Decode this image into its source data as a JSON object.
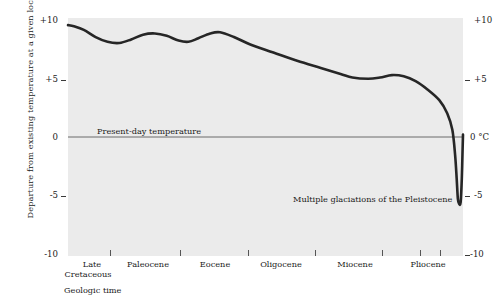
{
  "chart_data": {
    "type": "line",
    "title": "",
    "xlabel": "Geologic time",
    "ylabel": "Departure from existing temperature at a given locality",
    "ylim": [
      -10,
      10
    ],
    "yticks": [
      10,
      5,
      0,
      -5,
      -10
    ],
    "ytick_labels_left": [
      "+10",
      "+5",
      "0",
      "-5",
      "-10"
    ],
    "ytick_labels_right": [
      "+10",
      "+5",
      "0 °C",
      "-5",
      "-10"
    ],
    "grid": false,
    "legend": "none",
    "unit_label": "°C",
    "categories": [
      "Late Cretaceous",
      "Paleocene",
      "Eocene",
      "Oligocene",
      "Miocene",
      "Pliocene"
    ],
    "epoch_labels": [
      {
        "line1": "Late",
        "line2": "Cretaceous",
        "center_px": 92
      },
      {
        "line1": "Paleocene",
        "line2": "",
        "center_px": 148
      },
      {
        "line1": "Eocene",
        "line2": "",
        "center_px": 215
      },
      {
        "line1": "Oligocene",
        "line2": "",
        "center_px": 281
      },
      {
        "line1": "Miocene",
        "line2": "",
        "center_px": 355
      },
      {
        "line1": "Pliocene",
        "line2": "",
        "center_px": 428
      }
    ],
    "annotations": [
      {
        "text": "Present-day temperature",
        "value": 0,
        "role": "zero-line-label"
      },
      {
        "text": "Multiple glaciations of the Pleistocene",
        "value": -5.5,
        "role": "glaciation-label"
      }
    ],
    "series": [
      {
        "name": "Temperature departure",
        "color": "#262626",
        "points": [
          {
            "x": 0.0,
            "y": 9.4
          },
          {
            "x": 1.5,
            "y": 9.3
          },
          {
            "x": 4.0,
            "y": 9.0
          },
          {
            "x": 7.0,
            "y": 8.4
          },
          {
            "x": 10.0,
            "y": 8.0
          },
          {
            "x": 13.0,
            "y": 7.9
          },
          {
            "x": 16.0,
            "y": 8.2
          },
          {
            "x": 19.0,
            "y": 8.6
          },
          {
            "x": 22.0,
            "y": 8.7
          },
          {
            "x": 25.0,
            "y": 8.5
          },
          {
            "x": 28.0,
            "y": 8.1
          },
          {
            "x": 30.5,
            "y": 8.0
          },
          {
            "x": 33.0,
            "y": 8.3
          },
          {
            "x": 36.0,
            "y": 8.7
          },
          {
            "x": 38.5,
            "y": 8.8
          },
          {
            "x": 42.0,
            "y": 8.4
          },
          {
            "x": 46.0,
            "y": 7.8
          },
          {
            "x": 52.0,
            "y": 7.1
          },
          {
            "x": 58.0,
            "y": 6.4
          },
          {
            "x": 64.0,
            "y": 5.8
          },
          {
            "x": 69.0,
            "y": 5.3
          },
          {
            "x": 72.0,
            "y": 5.0
          },
          {
            "x": 76.0,
            "y": 4.9
          },
          {
            "x": 79.0,
            "y": 5.0
          },
          {
            "x": 82.0,
            "y": 5.2
          },
          {
            "x": 85.0,
            "y": 5.1
          },
          {
            "x": 88.0,
            "y": 4.7
          },
          {
            "x": 91.0,
            "y": 4.0
          },
          {
            "x": 94.0,
            "y": 3.1
          },
          {
            "x": 96.0,
            "y": 2.0
          },
          {
            "x": 97.3,
            "y": 0.6
          },
          {
            "x": 98.0,
            "y": -1.5
          },
          {
            "x": 98.4,
            "y": -3.5
          },
          {
            "x": 98.7,
            "y": -5.2
          },
          {
            "x": 99.0,
            "y": -5.6
          },
          {
            "x": 99.4,
            "y": -5.5
          },
          {
            "x": 99.7,
            "y": -3.5
          },
          {
            "x": 99.9,
            "y": -1.0
          },
          {
            "x": 100.0,
            "y": 0.2
          }
        ]
      }
    ],
    "zero_line": {
      "value": 0,
      "color": "#6b6b6b"
    }
  },
  "axis": {
    "x_tick_positions_px": [
      110,
      180,
      248,
      315,
      382,
      420,
      440
    ],
    "y_tick_positions": [
      10,
      5,
      0,
      -5,
      -10
    ]
  }
}
